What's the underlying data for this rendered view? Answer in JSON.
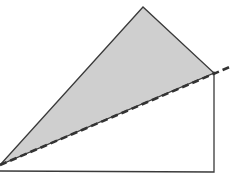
{
  "diagram": {
    "title": "",
    "width": 249,
    "height": 186,
    "colors": {
      "background": "#ffffff",
      "fill": "#cfcfcf",
      "edge": "#3a3a3a",
      "dashed": "#333333"
    },
    "shaded_triangle": {
      "points": [
        [
          0,
          165
        ],
        [
          143,
          7
        ],
        [
          214,
          73
        ]
      ]
    },
    "dashed_line": {
      "from": [
        0,
        165
      ],
      "to": [
        232,
        66
      ],
      "dasharray": "7,4",
      "stroke_width": 2.6
    },
    "right_triangle": {
      "points": [
        [
          0,
          171
        ],
        [
          214,
          172
        ],
        [
          214,
          73
        ]
      ]
    }
  }
}
